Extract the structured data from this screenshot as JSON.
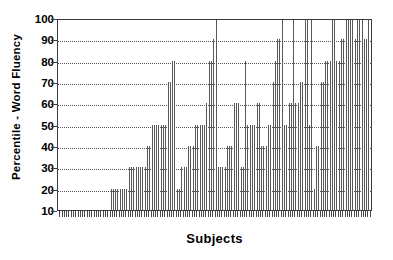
{
  "chart_data": {
    "type": "bar",
    "title": "",
    "subtitle": "",
    "xlabel": "Subjects",
    "ylabel": "Percentile - Word Fluency",
    "ylim": [
      10,
      100
    ],
    "xlim": [
      0,
      137
    ],
    "ytick_labels": [
      "10",
      "20",
      "30",
      "40",
      "50",
      "60",
      "70",
      "80",
      "90",
      "100"
    ],
    "yticks": [
      10,
      20,
      30,
      40,
      50,
      60,
      70,
      80,
      90,
      100
    ],
    "xtick_labels": [],
    "grid": "horizontal-dotted",
    "legend": "none",
    "baseline": 10,
    "series_name": "Subject percentile",
    "n_subjects": 137,
    "categories": [
      "1",
      "2",
      "3",
      "4",
      "5",
      "6",
      "7",
      "8",
      "9",
      "10",
      "11",
      "12",
      "13",
      "14",
      "15",
      "16",
      "17",
      "18",
      "19",
      "20",
      "21",
      "22",
      "23",
      "24",
      "25",
      "26",
      "27",
      "28",
      "29",
      "30",
      "31",
      "32",
      "33",
      "34",
      "35",
      "36",
      "37",
      "38",
      "39",
      "40",
      "41",
      "42",
      "43",
      "44",
      "45",
      "46",
      "47",
      "48",
      "49",
      "50",
      "51",
      "52",
      "53",
      "54",
      "55",
      "56",
      "57",
      "58",
      "59",
      "60",
      "61",
      "62",
      "63",
      "64",
      "65",
      "66",
      "67",
      "68",
      "69",
      "70",
      "71",
      "72",
      "73",
      "74",
      "75",
      "76",
      "77",
      "78",
      "79",
      "80",
      "81",
      "82",
      "83",
      "84",
      "85",
      "86",
      "87",
      "88",
      "89",
      "90",
      "91",
      "92",
      "93",
      "94",
      "95",
      "96",
      "97",
      "98",
      "99",
      "100",
      "101",
      "102",
      "103",
      "104",
      "105",
      "106",
      "107",
      "108",
      "109",
      "110",
      "111",
      "112",
      "113",
      "114",
      "115",
      "116",
      "117",
      "118",
      "119",
      "120",
      "121",
      "122",
      "123",
      "124",
      "125",
      "126",
      "127",
      "128",
      "129",
      "130",
      "131",
      "132",
      "133",
      "134",
      "135",
      "136",
      "137"
    ],
    "values": [
      10,
      10,
      10,
      10,
      10,
      10,
      10,
      10,
      10,
      10,
      10,
      10,
      10,
      10,
      10,
      10,
      10,
      10,
      10,
      10,
      10,
      10,
      20,
      20,
      20,
      20,
      20,
      20,
      20,
      20,
      30,
      30,
      30,
      30,
      30,
      30,
      30,
      30,
      40,
      40,
      50,
      50,
      50,
      50,
      50,
      50,
      50,
      70,
      70,
      80,
      80,
      20,
      20,
      30,
      30,
      30,
      40,
      40,
      40,
      50,
      50,
      50,
      50,
      50,
      60,
      80,
      80,
      90,
      100,
      30,
      30,
      30,
      30,
      40,
      40,
      40,
      60,
      60,
      60,
      30,
      30,
      80,
      50,
      50,
      50,
      50,
      60,
      60,
      40,
      40,
      40,
      50,
      50,
      70,
      80,
      90,
      90,
      100,
      50,
      50,
      60,
      60,
      100,
      60,
      60,
      70,
      70,
      100,
      100,
      50,
      100,
      20,
      40,
      40,
      70,
      70,
      80,
      80,
      80,
      100,
      100,
      80,
      80,
      90,
      90,
      100,
      100,
      100,
      100,
      90,
      100,
      100,
      100,
      90,
      90,
      100,
      100
    ]
  }
}
